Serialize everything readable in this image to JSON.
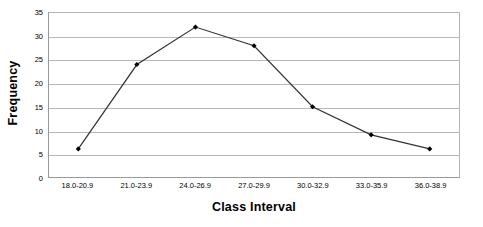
{
  "chart_data": {
    "type": "line",
    "title": "",
    "xlabel": "Class Interval",
    "ylabel": "Frequency",
    "categories": [
      "18.0-20.9",
      "21.0-23.9",
      "24.0-26.9",
      "27.0-29.9",
      "30.0-32.9",
      "33.0-35.9",
      "36.0-38.9"
    ],
    "values": [
      6,
      24,
      32,
      28,
      15,
      9,
      6
    ],
    "series": [
      {
        "name": "Frequency",
        "values": [
          6,
          24,
          32,
          28,
          15,
          9,
          6
        ]
      }
    ],
    "ylim": [
      0,
      35
    ],
    "yticks": [
      0,
      5,
      10,
      15,
      20,
      25,
      30,
      35
    ],
    "ytick_labels": [
      "0",
      "5",
      "10",
      "15",
      "20",
      "25",
      "30",
      "35"
    ],
    "grid": "horizontal",
    "legend": "none",
    "marker": "filled-diamond",
    "line_color": "#333333",
    "marker_color": "#000000",
    "grid_color": "#b8b8b8",
    "plot_border_color": "#9a9a9a",
    "background_color": "#ffffff"
  }
}
